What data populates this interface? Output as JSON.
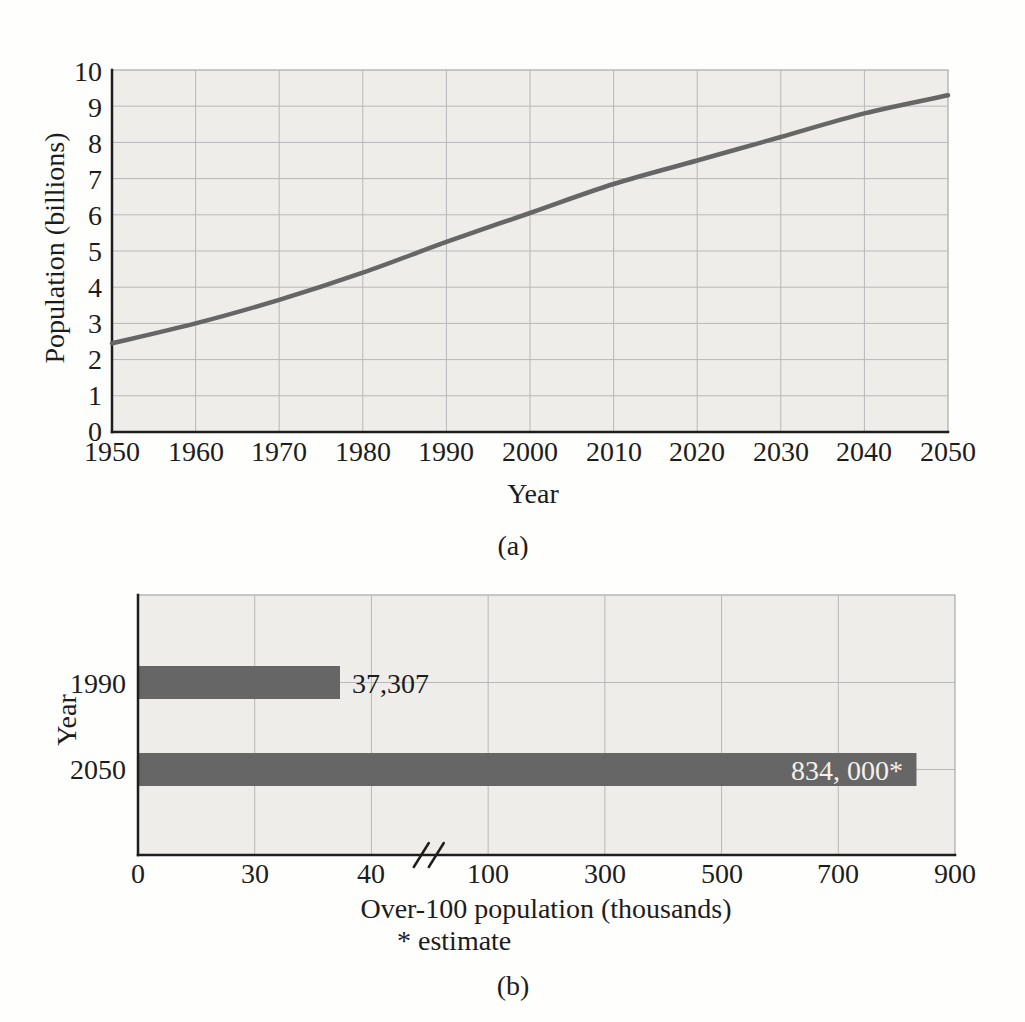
{
  "figure": {
    "caption_a": "(a)",
    "caption_b": "(b)"
  },
  "colors": {
    "series_gray": "#666666",
    "plot_bg": "#eeedea",
    "grid": "#b8b8b8",
    "plot_border": "#a8a8a8",
    "axis": "#1e1e1e",
    "text": "#1c1c1c",
    "bar_label_white": "#f4f1ea"
  },
  "chart_data": [
    {
      "type": "line",
      "title": "",
      "xlabel": "Year",
      "ylabel": "Population (billions)",
      "xlim": [
        1950,
        2050
      ],
      "ylim": [
        0,
        10
      ],
      "grid": true,
      "legend": "none",
      "xticks": [
        1950,
        1960,
        1970,
        1980,
        1990,
        2000,
        2010,
        2020,
        2030,
        2040,
        2050
      ],
      "yticks": [
        0,
        1,
        2,
        3,
        4,
        5,
        6,
        7,
        8,
        9,
        10
      ],
      "series": [
        {
          "name": "population-projection",
          "x": [
            1950,
            1960,
            1970,
            1980,
            1990,
            2000,
            2010,
            2020,
            2030,
            2040,
            2050
          ],
          "y": [
            2.45,
            3.0,
            3.65,
            4.4,
            5.25,
            6.05,
            6.85,
            7.5,
            8.15,
            8.8,
            9.3
          ]
        }
      ]
    },
    {
      "type": "bar",
      "orientation": "horizontal",
      "title": "",
      "xlabel": "Over-100 population (thousands)",
      "ylabel": "Year",
      "footnote": "* estimate",
      "grid": true,
      "categories": [
        "1990",
        "2050"
      ],
      "values": [
        37.307,
        834
      ],
      "value_labels": [
        "37,307",
        "834, 000*"
      ],
      "xticks": [
        0,
        30,
        40,
        100,
        300,
        500,
        700,
        900
      ],
      "axis_break": {
        "between": [
          40,
          100
        ],
        "symbol": "//"
      }
    }
  ]
}
